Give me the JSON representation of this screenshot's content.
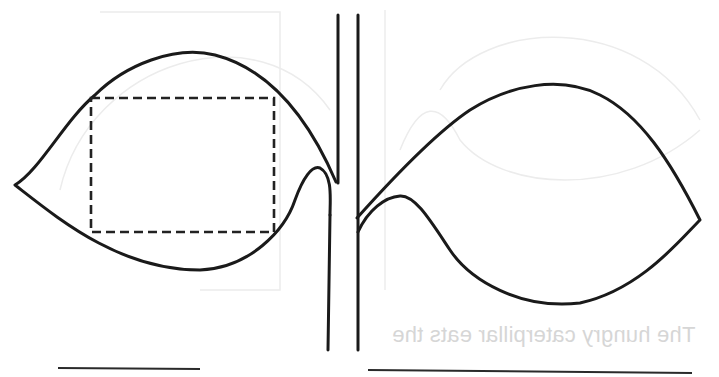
{
  "worksheet": {
    "title": "",
    "bleed_through_text": "The hungry caterpillar eats the",
    "colors": {
      "ink": "#1a1a1a",
      "background": "#ffffff",
      "bleed_through": "#d6d6d6"
    },
    "elements": [
      {
        "type": "leaf",
        "side": "left",
        "has_dashed_box": true
      },
      {
        "type": "stem",
        "orientation": "vertical"
      },
      {
        "type": "leaf",
        "side": "right",
        "has_dashed_box": false
      },
      {
        "type": "writing-line",
        "position": "bottom-left"
      },
      {
        "type": "writing-line",
        "position": "bottom-right"
      }
    ]
  }
}
